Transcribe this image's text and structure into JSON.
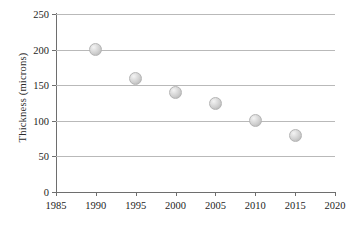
{
  "chart_data": {
    "type": "scatter",
    "title": "",
    "xlabel": "",
    "ylabel": "Thickness (microns)",
    "x": [
      1990,
      1995,
      2000,
      2005,
      2010,
      2015
    ],
    "values": [
      200,
      160,
      140,
      125,
      100,
      80
    ],
    "series": [
      {
        "name": "Thickness",
        "points": [
          {
            "x": 1990,
            "y": 200
          },
          {
            "x": 1995,
            "y": 160
          },
          {
            "x": 2000,
            "y": 140
          },
          {
            "x": 2005,
            "y": 125
          },
          {
            "x": 2010,
            "y": 100
          },
          {
            "x": 2015,
            "y": 80
          }
        ]
      }
    ],
    "xlim": [
      1985,
      2020
    ],
    "ylim": [
      0,
      250
    ],
    "xticks": [
      1985,
      1990,
      1995,
      2000,
      2005,
      2010,
      2015,
      2020
    ],
    "yticks": [
      0,
      50,
      100,
      150,
      200,
      250
    ],
    "xtick_labels": [
      "1985",
      "1990",
      "1995",
      "2000",
      "2005",
      "2010",
      "2015",
      "2020"
    ],
    "ytick_labels": [
      "0",
      "50",
      "100",
      "150",
      "200",
      "250"
    ],
    "grid": "horizontal",
    "legend": "none",
    "marker_style": "gray-sphere",
    "colors": {
      "marker_fill": "#d0d0d0",
      "marker_edge": "#b4b4b4",
      "gridline": "#b9b9b9",
      "axis": "#6e6e6e",
      "text": "#1d1d1d",
      "background": "#ffffff"
    }
  }
}
